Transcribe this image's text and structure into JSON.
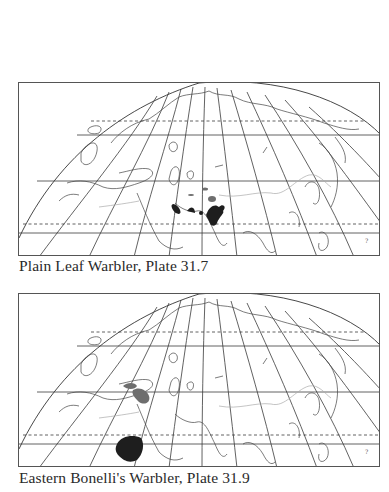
{
  "page": {
    "background": "#ffffff"
  },
  "maps": [
    {
      "id": "map1",
      "caption": "Plain Leaf Warbler, Plate 31.7",
      "species": "Plain Leaf Warbler",
      "plate": "31.7",
      "range_color_dark": "#1e1e1e",
      "range_color_mid": "#6e6e6e",
      "range_regions": [
        "Central Asia mountains (Tien Shan / Pamir / Hindu Kush)",
        "Afghanistan",
        "Northern Pakistan / Kashmir"
      ]
    },
    {
      "id": "map2",
      "caption": "Eastern Bonelli's Warbler, Plate 31.9",
      "species": "Eastern Bonelli's Warbler",
      "plate": "31.9",
      "range_color_dark": "#1e1e1e",
      "range_color_mid": "#6e6e6e",
      "range_regions": [
        "Balkans / Turkey (breeding)",
        "Sahel / Sudan (wintering)"
      ]
    }
  ],
  "legend": {
    "breeding_shade": "mid gray",
    "wintering_shade": "dark"
  }
}
